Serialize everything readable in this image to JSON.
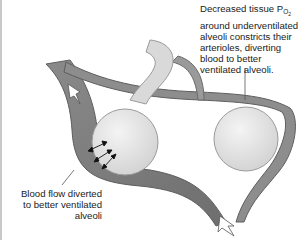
{
  "figure": {
    "type": "physiology-diagram"
  },
  "labels": {
    "top": {
      "prefix": "Decreased tissue P",
      "subscript": "O",
      "subsubscript": "2",
      "rest": " around underventilated alveoli constricts their arterioles, diverting blood to better ventilated alveoli."
    },
    "bottom": {
      "text": "Blood flow diverted to better ventilated alveoli"
    }
  },
  "colors": {
    "vessel": "#7d7d7d",
    "vessel_highlight": "#a9a9a9",
    "alveolus": "#e2e2e2",
    "alveolus_edge": "#9a9a9a",
    "leader_line": "#555555",
    "text": "#222222"
  }
}
